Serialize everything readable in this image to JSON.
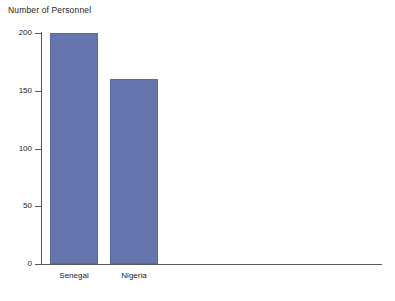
{
  "chart_data": {
    "type": "bar",
    "title": "Number of Personnel",
    "xlabel": "",
    "ylabel": "Number of Personnel",
    "categories": [
      "Senegal",
      "Nigeria"
    ],
    "values": [
      200,
      160
    ],
    "series": [
      {
        "name": "Number of Personnel",
        "values": [
          200,
          160
        ]
      }
    ],
    "ylim": [
      0,
      200
    ],
    "yticks": [
      0,
      50,
      100,
      150,
      200
    ],
    "ytick_labels": [
      "0",
      "50",
      "100",
      "150",
      "200"
    ],
    "grid": false,
    "legend": false,
    "bar_color": "#6576ae",
    "axis_color": "#58585c",
    "text_color": "#1c1c1c",
    "background": "#ffffff"
  }
}
